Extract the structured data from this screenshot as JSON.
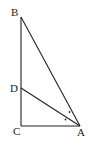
{
  "diagram": {
    "points": {
      "A": "A",
      "B": "B",
      "C": "C",
      "D": "D"
    },
    "segments": [
      "BC",
      "CA",
      "AB",
      "AD"
    ],
    "right_angle_at": "C",
    "equal_angle_marks": [
      "angle BAD",
      "angle DAC"
    ],
    "stroke_color": "#222222"
  }
}
